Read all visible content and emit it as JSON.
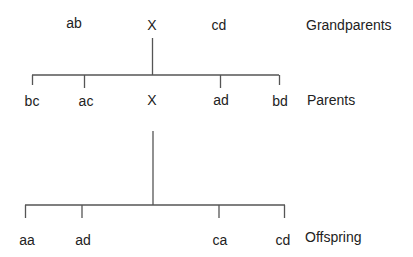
{
  "generations": {
    "grandparents": {
      "label": "Grandparents",
      "members": [
        "ab",
        "X",
        "cd"
      ]
    },
    "parents": {
      "label": "Parents",
      "members": [
        "bc",
        "ac",
        "X",
        "ad",
        "bd"
      ]
    },
    "offspring": {
      "label": "Offspring",
      "members": [
        "aa",
        "ad",
        "ca",
        "cd"
      ]
    }
  },
  "colors": {
    "line": "#555555",
    "text": "#222222",
    "background": "#ffffff"
  }
}
